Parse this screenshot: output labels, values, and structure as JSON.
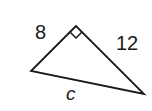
{
  "diagram": {
    "type": "right-triangle",
    "labels": {
      "leg_left": "8",
      "leg_right": "12",
      "hypotenuse": "c"
    },
    "right_angle_marker": "square-corner",
    "colors": {
      "stroke": "#1a1a1a",
      "background": "#ffffff"
    }
  }
}
